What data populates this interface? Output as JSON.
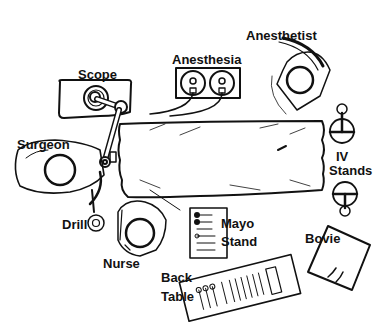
{
  "diagram": {
    "type": "operating-room-layout",
    "labels": {
      "scope": "Scope",
      "anesthesia": "Anesthesia",
      "anesthetist": "Anesthetist",
      "surgeon": "Surgeon",
      "iv_line1": "IV",
      "iv_line2": "Stands",
      "drill": "Drill",
      "nurse": "Nurse",
      "mayo_line1": "Mayo",
      "mayo_line2": "Stand",
      "bovie": "Bovie",
      "back_line1": "Back",
      "back_line2": "Table"
    },
    "colors": {
      "ink": "#111111",
      "background": "#ffffff"
    }
  }
}
